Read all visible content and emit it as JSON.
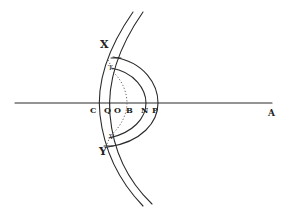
{
  "figure": {
    "type": "geometric-optics-diagram",
    "axis_label_end": "A",
    "axis_labels": [
      "C",
      "Q",
      "O",
      "B",
      "N",
      "P"
    ],
    "upper_labels": [
      "X",
      "T"
    ],
    "lower_labels": [
      "Y",
      "V"
    ],
    "ink_color": "#2a2a2a",
    "background": "#ffffff"
  },
  "labels": {
    "X": "X",
    "T": "T",
    "Y": "Y",
    "V": "V",
    "C": "C",
    "Q": "Q",
    "O": "O",
    "B": "B",
    "N": "N",
    "P": "P",
    "A": "A"
  }
}
